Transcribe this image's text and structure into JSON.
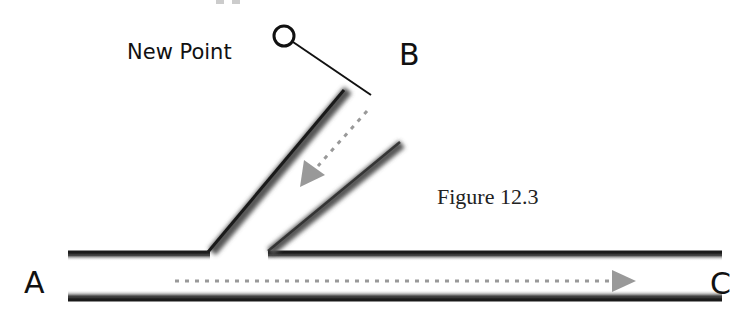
{
  "diagram": {
    "caption": "Figure 12.3",
    "labels": {
      "a": "A",
      "b": "B",
      "c": "C",
      "new_point": "New Point"
    },
    "colors": {
      "pipe_edge": "#1a1a1a",
      "flow_arrow": "#999999",
      "text": "#111111",
      "background": "#ffffff"
    },
    "flows": [
      {
        "from": "A",
        "to": "C",
        "style": "dotted-arrow"
      },
      {
        "from": "B",
        "to": "junction",
        "style": "dotted-arrow"
      }
    ],
    "markers": [
      {
        "name": "new-point",
        "shape": "circle",
        "leader_to": "B-branch-end"
      }
    ]
  }
}
